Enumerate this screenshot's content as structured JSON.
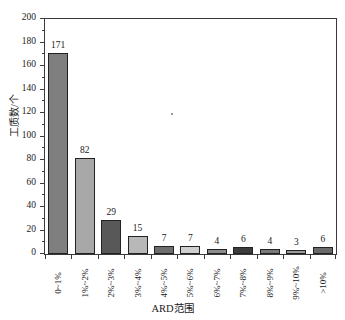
{
  "chart_data": {
    "type": "bar",
    "title": "",
    "xlabel": "ARD范围",
    "ylabel": "工质数/个",
    "categories": [
      "0~1%",
      "1%~2%",
      "2%~3%",
      "3%~4%",
      "4%~5%",
      "5%~6%",
      "6%~7%",
      "7%~8%",
      "8%~9%",
      "9%~10%",
      ">10%"
    ],
    "values": [
      171,
      82,
      29,
      15,
      7,
      7,
      4,
      6,
      4,
      3,
      6
    ],
    "ylim": [
      0,
      200
    ],
    "ytick_labels": [
      "0",
      "20",
      "40",
      "60",
      "80",
      "100",
      "120",
      "140",
      "160",
      "180",
      "200"
    ],
    "ytick_values": [
      0,
      20,
      40,
      60,
      80,
      100,
      120,
      140,
      160,
      180,
      200
    ],
    "minor_tick_step": 10,
    "grid": false,
    "legend": "none",
    "show_value_labels": true,
    "bar_colors": [
      "#7f7f7f",
      "#a8a8a8",
      "#585858",
      "#b8b8b8",
      "#6e6e6e",
      "#cfcfcf",
      "#8d8d8d",
      "#3c3c3c",
      "#7a7a7a",
      "#9c9c9c",
      "#6a6a6a"
    ],
    "bar_edge_color": "#222222",
    "axis_color": "#3a3a3a",
    "background_color": "#ffffff",
    "text_color": "#1a1a1a"
  }
}
